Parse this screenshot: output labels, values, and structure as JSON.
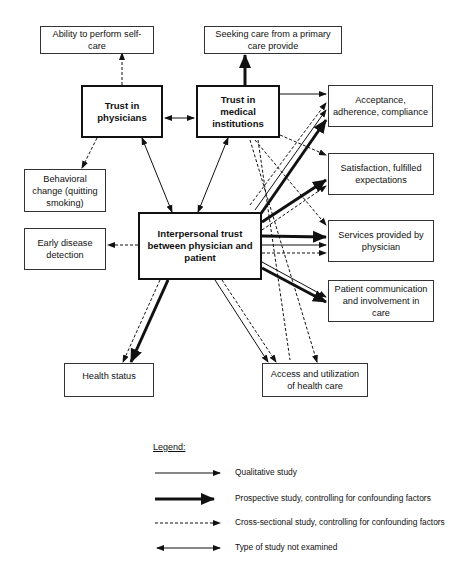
{
  "nodes": {
    "self_care": "Ability to perform self-care",
    "primary_care": "Seeking care from a primary care provide",
    "trust_physicians": "Trust in physicians",
    "trust_institutions": "Trust in medical institutions",
    "acceptance": "Acceptance, adherence, compliance",
    "satisfaction": "Satisfaction, fulfilled expectations",
    "behavioral": "Behavioral change (quitting smoking)",
    "early_detection": "Early disease detection",
    "interpersonal": "Interpersonal trust between physician and patient",
    "services": "Services provided by physician",
    "communication": "Patient communication and involvement in care",
    "health_status": "Health status",
    "access": "Access and utilization of health care"
  },
  "legend": {
    "title": "Legend:",
    "items": [
      {
        "style": "thin-solid",
        "label": "Qualitative study"
      },
      {
        "style": "double-thick",
        "label": "Prospective study, controlling for confounding factors"
      },
      {
        "style": "dashed",
        "label": "Cross-sectional study, controlling for confounding factors"
      },
      {
        "style": "bidirectional",
        "label": "Type of study not examined"
      }
    ]
  },
  "colors": {
    "line": "#111111",
    "box_border": "#333333",
    "background": "#ffffff"
  }
}
